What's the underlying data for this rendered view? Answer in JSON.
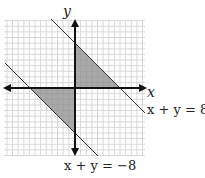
{
  "diagram": {
    "type": "coordinate-plane",
    "axes": {
      "x_label": "x",
      "y_label": "y"
    },
    "lines": [
      {
        "equation": "x + y = 8",
        "label": "x + y = 8"
      },
      {
        "equation": "x + y = -8",
        "label": "x + y = −8"
      }
    ],
    "shaded_regions": [
      {
        "description": "triangle bounded by y-axis, x-axis and x + y = 8 (Quadrant I)",
        "vertices": [
          [
            0,
            0
          ],
          [
            0,
            8
          ],
          [
            8,
            0
          ]
        ]
      },
      {
        "description": "triangle bounded by y-axis, x-axis and x + y = -8 (Quadrant III)",
        "vertices": [
          [
            0,
            0
          ],
          [
            0,
            -8
          ],
          [
            -8,
            0
          ]
        ]
      }
    ],
    "colors": {
      "grid": "#c8c8c8",
      "shade": "#8c8c8c",
      "axis": "#111111",
      "line": "#333333"
    }
  }
}
